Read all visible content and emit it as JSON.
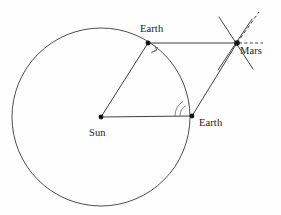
{
  "figure": {
    "background_color": "#fefefe",
    "ink_color": "#2b2b2b",
    "width": 281,
    "height": 215
  },
  "labels": {
    "earth_top": "Earth",
    "earth_bottom": "Earth",
    "sun": "Sun",
    "mars": "Mars"
  },
  "nodes": {
    "sun": {
      "name": "Sun",
      "x": 101,
      "y": 117,
      "radius": 2.4
    },
    "earth_top": {
      "name": "Earth",
      "x": 148,
      "y": 43,
      "radius": 2.4
    },
    "earth_bottom": {
      "name": "Earth",
      "x": 192,
      "y": 116,
      "radius": 2.4
    },
    "mars": {
      "name": "Mars",
      "x": 237,
      "y": 43,
      "radius": 2.6
    }
  },
  "orbit": {
    "name": "earth-orbit-circle",
    "center_x": 101,
    "center_y": 117,
    "radius": 89
  },
  "segments": [
    {
      "name": "sun-to-earth-top",
      "x1": 101,
      "y1": 117,
      "x2": 148,
      "y2": 43,
      "style": "solid"
    },
    {
      "name": "sun-to-earth-bottom",
      "x1": 101,
      "y1": 117,
      "x2": 192,
      "y2": 116,
      "style": "solid"
    },
    {
      "name": "earth-top-to-mars",
      "x1": 148,
      "y1": 43,
      "x2": 237,
      "y2": 43,
      "style": "solid"
    },
    {
      "name": "earth-bottom-to-mars",
      "x1": 192,
      "y1": 116,
      "x2": 237,
      "y2": 43,
      "style": "solid"
    }
  ],
  "sight_lines": [
    {
      "name": "mars-cross-line-a",
      "x1": 219,
      "y1": 17,
      "x2": 253,
      "y2": 69,
      "style": "solid"
    },
    {
      "name": "mars-cross-line-b",
      "x1": 218,
      "y1": 70,
      "x2": 252,
      "y2": 19,
      "style": "solid"
    },
    {
      "name": "mars-dashed-sight-line",
      "x1": 237,
      "y1": 43,
      "x2": 259,
      "y2": 12,
      "style": "dashed"
    },
    {
      "name": "mars-dashed-horizontal",
      "x1": 239,
      "y1": 43,
      "x2": 263,
      "y2": 43,
      "style": "dashed"
    }
  ],
  "angle_markers": [
    {
      "name": "right-angle-arc-earth-top",
      "at": "earth_top",
      "arcs": 1
    },
    {
      "name": "double-angle-arc-earth-bottom",
      "at": "earth_bottom",
      "arcs": 2
    }
  ],
  "label_positions": {
    "earth_top": {
      "x": 140,
      "y": 32
    },
    "earth_bottom": {
      "x": 199,
      "y": 126
    },
    "sun": {
      "x": 89,
      "y": 136
    },
    "mars": {
      "x": 240,
      "y": 54
    }
  }
}
